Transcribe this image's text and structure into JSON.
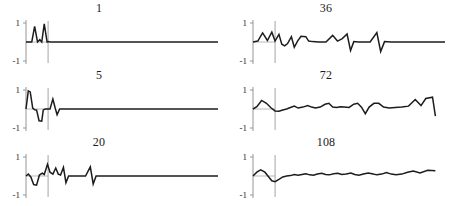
{
  "figure": {
    "width": 453,
    "height": 206,
    "background": "#ffffff",
    "line_color": "#1c1c1c",
    "axis_color": "#8a8a8a",
    "marker_color": "#9a9a9a"
  },
  "chart_data": {
    "type": "line",
    "title": "",
    "subtitle": "",
    "xlabel": "",
    "ylabel": "",
    "grid": false,
    "legend": null,
    "layout": {
      "rows": 3,
      "cols": 2,
      "order": "column-major"
    },
    "shared": {
      "ytick_labels": [
        "1",
        "-1"
      ],
      "ylim": [
        -1,
        1
      ],
      "xlim": [
        0,
        1
      ],
      "zero_baseline": true,
      "vertical_marker_x": 0.115
    },
    "panels": [
      {
        "title": "1",
        "position": {
          "row": 0,
          "col": 0
        },
        "ytick_labels": [
          "1",
          "-1"
        ],
        "ylim": [
          -1,
          1
        ],
        "vertical_marker_x": 0.115,
        "y": [
          0,
          0,
          0,
          0.82,
          0,
          0.12,
          0,
          0.95,
          0,
          0.02,
          0,
          0,
          0,
          0,
          0,
          0,
          0,
          0,
          0,
          0,
          0,
          0,
          0,
          0,
          0,
          0,
          0,
          0,
          0,
          0,
          0,
          0,
          0,
          0,
          0,
          0,
          0,
          0,
          0,
          0
        ],
        "x": [
          0.0,
          0.015,
          0.03,
          0.045,
          0.06,
          0.072,
          0.082,
          0.095,
          0.11,
          0.118,
          0.125,
          0.16,
          0.2,
          0.24,
          0.28,
          0.32,
          0.36,
          0.4,
          0.44,
          0.48,
          0.52,
          0.56,
          0.6,
          0.63,
          0.66,
          0.69,
          0.72,
          0.75,
          0.78,
          0.81,
          0.84,
          0.86,
          0.88,
          0.9,
          0.92,
          0.94,
          0.96,
          0.97,
          0.985,
          1.0
        ]
      },
      {
        "title": "5",
        "position": {
          "row": 1,
          "col": 0
        },
        "ytick_labels": [
          "1",
          "-1"
        ],
        "ylim": [
          -1,
          1
        ],
        "vertical_marker_x": 0.115,
        "y": [
          0,
          0.95,
          0.9,
          0.05,
          -0.04,
          -0.05,
          -0.62,
          -0.64,
          -0.05,
          0.0,
          0.0,
          0.0,
          0.52,
          0.05,
          -0.3,
          0.0,
          0,
          0,
          0,
          0,
          0,
          0,
          0,
          0,
          0,
          0,
          0,
          0,
          0,
          0,
          0,
          0,
          0,
          0,
          0,
          0
        ],
        "x": [
          0.0,
          0.012,
          0.022,
          0.035,
          0.045,
          0.055,
          0.068,
          0.082,
          0.09,
          0.1,
          0.112,
          0.125,
          0.14,
          0.152,
          0.162,
          0.175,
          0.21,
          0.25,
          0.29,
          0.33,
          0.37,
          0.41,
          0.45,
          0.49,
          0.53,
          0.57,
          0.61,
          0.65,
          0.69,
          0.73,
          0.78,
          0.83,
          0.88,
          0.92,
          0.96,
          1.0
        ]
      },
      {
        "title": "20",
        "position": {
          "row": 2,
          "col": 0
        },
        "ytick_labels": [
          "1",
          "-1"
        ],
        "ylim": [
          -1,
          1
        ],
        "vertical_marker_x": 0.115,
        "y": [
          0,
          0.1,
          -0.05,
          -0.45,
          -0.48,
          0.05,
          0.15,
          0.08,
          0.62,
          0.2,
          0.1,
          0.42,
          0.1,
          0.05,
          0.45,
          -0.35,
          0.0,
          0.0,
          0.0,
          0.0,
          0.48,
          -0.42,
          0.0,
          0,
          0,
          0,
          0,
          0,
          0,
          0,
          0,
          0,
          0,
          0,
          0,
          0
        ],
        "x": [
          0.0,
          0.012,
          0.025,
          0.04,
          0.055,
          0.07,
          0.085,
          0.095,
          0.112,
          0.125,
          0.14,
          0.155,
          0.168,
          0.18,
          0.195,
          0.208,
          0.222,
          0.25,
          0.28,
          0.31,
          0.335,
          0.35,
          0.365,
          0.4,
          0.44,
          0.48,
          0.52,
          0.57,
          0.62,
          0.67,
          0.72,
          0.78,
          0.84,
          0.9,
          0.95,
          1.0
        ]
      },
      {
        "title": "36",
        "position": {
          "row": 0,
          "col": 1
        },
        "ytick_labels": [
          "1",
          "-1"
        ],
        "ylim": [
          -1,
          1
        ],
        "vertical_marker_x": 0.115,
        "y": [
          0,
          0.05,
          0.48,
          0.08,
          0.52,
          0.05,
          0.4,
          -0.12,
          -0.2,
          -0.08,
          0.28,
          -0.28,
          0.05,
          0.3,
          0.28,
          0.05,
          0.02,
          0.0,
          0.0,
          0.35,
          0.05,
          0.18,
          0.42,
          -0.45,
          0.02,
          0.0,
          0.0,
          0.0,
          0.5,
          -0.5,
          0.02,
          0.0,
          0.0,
          0.0,
          0.0,
          0.0,
          0.0,
          0.0
        ],
        "x": [
          0.0,
          0.025,
          0.05,
          0.075,
          0.098,
          0.115,
          0.135,
          0.15,
          0.165,
          0.18,
          0.2,
          0.215,
          0.232,
          0.25,
          0.275,
          0.29,
          0.31,
          0.34,
          0.38,
          0.415,
          0.44,
          0.465,
          0.49,
          0.508,
          0.525,
          0.55,
          0.58,
          0.61,
          0.645,
          0.665,
          0.685,
          0.72,
          0.76,
          0.8,
          0.85,
          0.9,
          0.95,
          1.0
        ]
      },
      {
        "title": "72",
        "position": {
          "row": 1,
          "col": 1
        },
        "ytick_labels": [
          "1",
          "-1"
        ],
        "ylim": [
          -1,
          1
        ],
        "vertical_marker_x": 0.115,
        "y": [
          0,
          0.12,
          0.45,
          0.3,
          0.05,
          -0.1,
          -0.12,
          -0.05,
          0.0,
          0.08,
          0.15,
          0.05,
          0.1,
          0.18,
          0.1,
          0.05,
          0.1,
          0.25,
          0.3,
          0.1,
          0.08,
          0.12,
          0.1,
          0.08,
          0.25,
          0.3,
          0.1,
          -0.25,
          0.1,
          0.3,
          0.3,
          0.1,
          0.05,
          0.08,
          0.1,
          0.15,
          0.5,
          0.18,
          0.55,
          0.62,
          -0.38
        ],
        "x": [
          0.0,
          0.02,
          0.045,
          0.07,
          0.095,
          0.115,
          0.135,
          0.155,
          0.175,
          0.195,
          0.215,
          0.235,
          0.26,
          0.285,
          0.305,
          0.325,
          0.35,
          0.375,
          0.395,
          0.415,
          0.435,
          0.455,
          0.475,
          0.5,
          0.525,
          0.545,
          0.565,
          0.585,
          0.605,
          0.63,
          0.655,
          0.68,
          0.71,
          0.74,
          0.775,
          0.81,
          0.845,
          0.875,
          0.9,
          0.935,
          0.95
        ]
      },
      {
        "title": "108",
        "position": {
          "row": 2,
          "col": 1
        },
        "ytick_labels": [
          "1",
          "-1"
        ],
        "ylim": [
          -1,
          1
        ],
        "vertical_marker_x": 0.115,
        "y": [
          0,
          0.2,
          0.32,
          0.2,
          -0.05,
          -0.25,
          -0.3,
          -0.18,
          -0.05,
          0.0,
          0.02,
          0.08,
          0.04,
          0.08,
          0.12,
          0.06,
          0.04,
          0.1,
          0.14,
          0.08,
          0.06,
          0.12,
          0.14,
          0.08,
          0.1,
          0.16,
          0.08,
          0.04,
          0.1,
          0.16,
          0.12,
          0.06,
          0.1,
          0.18,
          0.1,
          0.06,
          0.1,
          0.2,
          0.26,
          0.16,
          0.3,
          0.28
        ],
        "x": [
          0.0,
          0.02,
          0.04,
          0.062,
          0.082,
          0.098,
          0.115,
          0.135,
          0.155,
          0.175,
          0.195,
          0.215,
          0.235,
          0.255,
          0.275,
          0.295,
          0.315,
          0.335,
          0.358,
          0.378,
          0.398,
          0.42,
          0.442,
          0.462,
          0.485,
          0.51,
          0.53,
          0.552,
          0.575,
          0.6,
          0.62,
          0.645,
          0.67,
          0.695,
          0.72,
          0.745,
          0.775,
          0.805,
          0.835,
          0.87,
          0.91,
          0.95
        ]
      }
    ]
  }
}
